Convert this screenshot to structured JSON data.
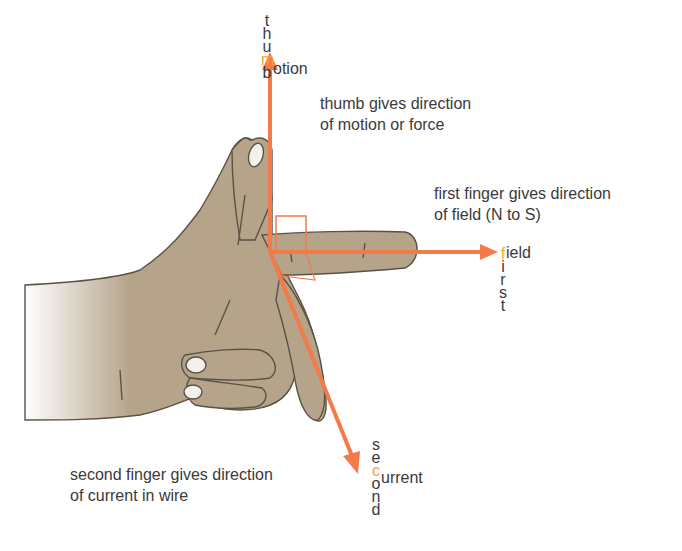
{
  "colors": {
    "arrow": "#f47a4a",
    "highlight": "#f5a33a",
    "skin": "#b5a48a",
    "outline": "#555555",
    "text": "#3a3a3a"
  },
  "thumb": {
    "vertical_word": [
      "t",
      "h",
      "u",
      "m",
      "b"
    ],
    "axis_word_rest": "otion",
    "axis_initial": "m",
    "description_line1": "thumb gives direction",
    "description_line2": "of motion or force"
  },
  "first_finger": {
    "vertical_word": [
      "f",
      "i",
      "r",
      "s",
      "t"
    ],
    "axis_word_rest": "ield",
    "axis_initial": "f",
    "description_line1": "first finger gives direction",
    "description_line2": "of field (N to S)"
  },
  "second_finger": {
    "vertical_word": [
      "s",
      "e",
      "c",
      "o",
      "n",
      "d"
    ],
    "axis_word_rest": "urrent",
    "axis_initial": "c",
    "description_line1": "second finger gives direction",
    "description_line2": "of current in wire"
  }
}
